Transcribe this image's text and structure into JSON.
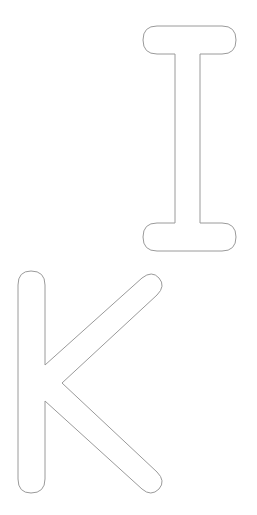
{
  "letters": [
    {
      "char": "I",
      "style": "outline"
    },
    {
      "char": "K",
      "style": "outline"
    }
  ],
  "colors": {
    "stroke": "#9a9a9a",
    "background": "#ffffff"
  }
}
